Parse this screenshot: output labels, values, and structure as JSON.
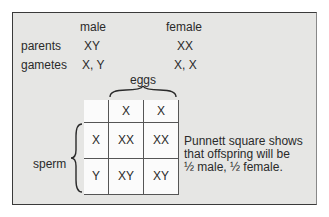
{
  "headers": {
    "male": "male",
    "female": "female"
  },
  "rows": {
    "parents": {
      "label": "parents",
      "male": "XY",
      "female": "XX"
    },
    "gametes": {
      "label": "gametes",
      "male": "X, Y",
      "female": "X, X"
    }
  },
  "eggs_label": "eggs",
  "sperm_label": "sperm",
  "punnett": {
    "col_headers": [
      "",
      "X",
      "X"
    ],
    "rows": [
      [
        "X",
        "XX",
        "XX"
      ],
      [
        "Y",
        "XY",
        "XY"
      ]
    ]
  },
  "caption": [
    "Punnett square shows",
    "that offspring will be",
    "½ male, ½ female."
  ],
  "colors": {
    "panel": "#e6e6e4",
    "border": "#3a3a3a",
    "cells": "#fbfbfb"
  }
}
